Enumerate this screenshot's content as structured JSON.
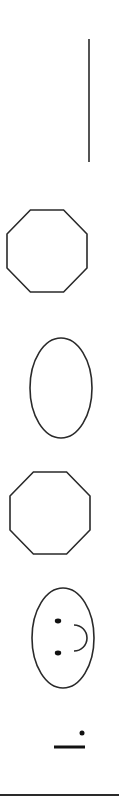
{
  "diagram": {
    "stroke_color": "#2a2a2a",
    "fill_color": "#ffffff",
    "background": "#ffffff",
    "shapes": [
      {
        "type": "vertical-line",
        "name": "vertical-line",
        "x": 89,
        "y1": 39,
        "y2": 162
      },
      {
        "type": "octagon",
        "name": "octagon-top",
        "cx": 47,
        "cy": 251,
        "w": 80,
        "h": 82
      },
      {
        "type": "ellipse",
        "name": "ellipse",
        "cx": 61,
        "cy": 388,
        "rx": 31,
        "ry": 50
      },
      {
        "type": "octagon",
        "name": "octagon-bottom",
        "cx": 50,
        "cy": 513,
        "w": 80,
        "h": 82
      },
      {
        "type": "smiley-face-rotated",
        "name": "smiley-face",
        "cx": 63,
        "cy": 638,
        "rx": 31,
        "ry": 50,
        "eyes": [
          {
            "cx": 58,
            "cy": 621
          },
          {
            "cx": 58,
            "cy": 653
          }
        ],
        "mouth": {
          "cx": 74,
          "cy": 638,
          "r": 13
        }
      },
      {
        "type": "dot",
        "name": "dot",
        "cx": 82,
        "cy": 733,
        "r": 2.5
      },
      {
        "type": "dash",
        "name": "dash",
        "x1": 54,
        "x2": 85,
        "y": 747
      },
      {
        "type": "horizontal-line",
        "name": "baseline",
        "x1": 0,
        "x2": 119,
        "y": 795
      }
    ]
  }
}
